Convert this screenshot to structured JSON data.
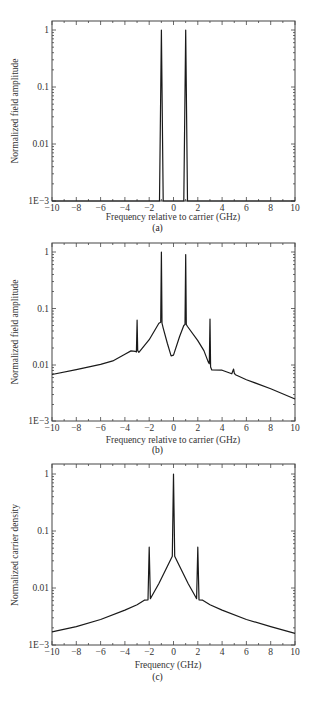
{
  "chart_data": [
    {
      "id": "a",
      "type": "line",
      "caption": "(a)",
      "title": "",
      "xlabel": "Frequency relative to carrier (GHz)",
      "ylabel": "Normalized field amplitude",
      "xlim": [
        -10,
        10
      ],
      "ylim": [
        0.001,
        1.45
      ],
      "yscale": "log",
      "xticks": [
        -10,
        -8,
        -6,
        -4,
        -2,
        0,
        2,
        4,
        6,
        8,
        10
      ],
      "xtick_labels": [
        "−10",
        "−8",
        "−6",
        "−4",
        "−2",
        "0",
        "2",
        "4",
        "6",
        "8",
        "10"
      ],
      "yticks": [
        1,
        0.1,
        0.01,
        0.001
      ],
      "ytick_labels": [
        "1",
        "0.1",
        "0.01",
        "1E−3"
      ],
      "grid": false,
      "legend": null,
      "series": [
        {
          "name": "field amplitude",
          "x": [
            -10,
            -1.15,
            -1.0,
            -0.85,
            0.85,
            1.0,
            1.15,
            10
          ],
          "y": [
            0.001,
            0.001,
            1.0,
            0.001,
            0.001,
            1.0,
            0.001,
            0.001
          ]
        }
      ]
    },
    {
      "id": "b",
      "type": "line",
      "caption": "(b)",
      "title": "",
      "xlabel": "Frequency relative to carrier (GHz)",
      "ylabel": "Normalized field amplitude",
      "xlim": [
        -10,
        10
      ],
      "ylim": [
        0.001,
        1.45
      ],
      "yscale": "log",
      "xticks": [
        -10,
        -8,
        -6,
        -4,
        -2,
        0,
        2,
        4,
        6,
        8,
        10
      ],
      "xtick_labels": [
        "−10",
        "−8",
        "−6",
        "−4",
        "−2",
        "0",
        "2",
        "4",
        "6",
        "8",
        "10"
      ],
      "yticks": [
        1,
        0.1,
        0.01,
        0.001
      ],
      "ytick_labels": [
        "1",
        "0.1",
        "0.01",
        "1E−3"
      ],
      "grid": false,
      "legend": null,
      "series": [
        {
          "name": "field amplitude",
          "x": [
            -10,
            -8,
            -6,
            -5,
            -4,
            -3.5,
            -3.15,
            -3.05,
            -3.0,
            -2.95,
            -2.85,
            -2,
            -1.2,
            -1.05,
            -1.0,
            -0.95,
            -0.85,
            -0.5,
            -0.2,
            0,
            0.5,
            0.85,
            0.95,
            1.0,
            1.05,
            1.15,
            2,
            2.5,
            2.85,
            2.95,
            3.0,
            3.05,
            3.15,
            4,
            4.8,
            4.95,
            5.0,
            5.1,
            6,
            8,
            10
          ],
          "y": [
            0.0068,
            0.0083,
            0.0103,
            0.0118,
            0.0155,
            0.0178,
            0.0175,
            0.017,
            0.062,
            0.018,
            0.0168,
            0.028,
            0.055,
            0.057,
            1.0,
            0.055,
            0.045,
            0.024,
            0.0145,
            0.015,
            0.032,
            0.05,
            0.052,
            0.9,
            0.052,
            0.048,
            0.027,
            0.018,
            0.0115,
            0.0105,
            0.065,
            0.0092,
            0.0082,
            0.0081,
            0.007,
            0.0085,
            0.0072,
            0.0067,
            0.0055,
            0.0038,
            0.0025
          ]
        }
      ]
    },
    {
      "id": "c",
      "type": "line",
      "caption": "(c)",
      "title": "",
      "xlabel": "Frequency (GHz)",
      "ylabel": "Normalized carrier density",
      "xlim": [
        -10,
        10
      ],
      "ylim": [
        0.001,
        1.45
      ],
      "yscale": "log",
      "xticks": [
        -10,
        -8,
        -6,
        -4,
        -2,
        0,
        2,
        4,
        6,
        8,
        10
      ],
      "xtick_labels": [
        "−10",
        "−8",
        "−6",
        "−4",
        "−2",
        "0",
        "2",
        "4",
        "6",
        "8",
        "10"
      ],
      "yticks": [
        1,
        0.1,
        0.01,
        0.001
      ],
      "ytick_labels": [
        "1",
        "0.1",
        "0.01",
        "1E−3"
      ],
      "grid": false,
      "legend": null,
      "series": [
        {
          "name": "carrier density",
          "x": [
            -10,
            -8,
            -6,
            -4,
            -3,
            -2.4,
            -2.1,
            -2.0,
            -1.9,
            -1.8,
            -1.2,
            -0.5,
            -0.1,
            0.0,
            0.1,
            0.5,
            1.2,
            1.8,
            1.9,
            2.0,
            2.1,
            2.4,
            3,
            4,
            6,
            8,
            10
          ],
          "y": [
            0.0017,
            0.0021,
            0.0028,
            0.0041,
            0.0051,
            0.0061,
            0.0062,
            0.052,
            0.0065,
            0.0071,
            0.012,
            0.024,
            0.036,
            1.0,
            0.036,
            0.024,
            0.012,
            0.0071,
            0.0065,
            0.052,
            0.0062,
            0.0061,
            0.0051,
            0.0041,
            0.0028,
            0.0021,
            0.0016
          ]
        }
      ]
    }
  ]
}
